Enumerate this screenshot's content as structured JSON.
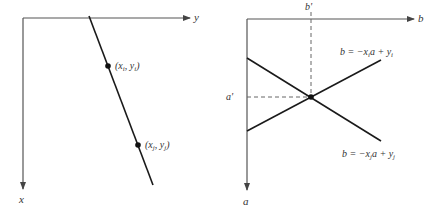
{
  "left_panel": {
    "title": "image space (x, y)",
    "axes": {
      "horizontal_label": "y",
      "vertical_label": "x"
    },
    "points": [
      {
        "label_var_x": "x",
        "label_sub": "i",
        "label_var_y": "y",
        "label_text": "(x_i, y_i)"
      },
      {
        "label_var_x": "x",
        "label_sub": "j",
        "label_var_y": "y",
        "label_text": "(x_j, y_j)"
      }
    ]
  },
  "right_panel": {
    "title": "parameter space (a, b)",
    "axes": {
      "horizontal_label": "b",
      "vertical_label": "a"
    },
    "intersection": {
      "a_label": "a'",
      "b_label": "b'"
    },
    "lines": [
      {
        "equation": "b = −x_i a + y_i",
        "lhs": "b = −x",
        "sub": "i",
        "mid": "a + y",
        "sub2": "i"
      },
      {
        "equation": "b = −x_j a + y_j",
        "lhs": "b = −x",
        "sub": "j",
        "mid": "a + y",
        "sub2": "j"
      }
    ]
  },
  "colors": {
    "axis": "#555555",
    "line": "#1a1a1a",
    "dash": "#666666",
    "text": "#333333"
  }
}
